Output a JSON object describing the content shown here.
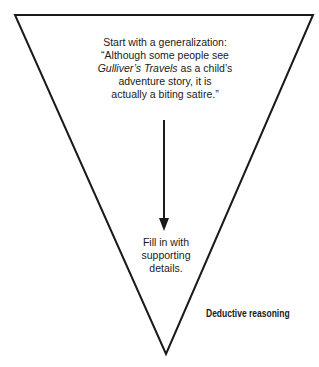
{
  "diagram": {
    "type": "inverted-triangle",
    "stroke_color": "#1a1a1a",
    "top_statement": {
      "line1": "Start with a generalization:",
      "line2": "“Although some people see",
      "line3_italic": "Gulliver’s Travels",
      "line3_rest": " as a child’s",
      "line4": "adventure story, it is",
      "line5": "actually a biting satire.”"
    },
    "bottom_statement": {
      "line1": "Fill in with",
      "line2": "supporting",
      "line3": "details."
    },
    "caption": "Deductive reasoning"
  }
}
